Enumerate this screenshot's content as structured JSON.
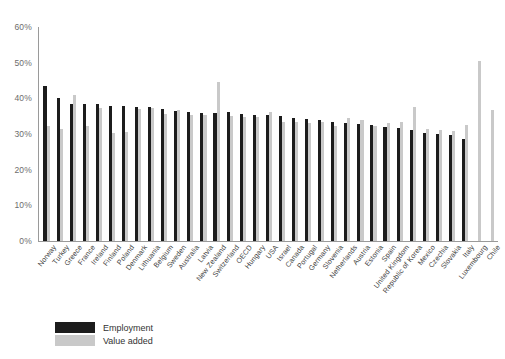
{
  "chart_data": {
    "type": "bar",
    "title": "",
    "subtitle": "",
    "xlabel": "",
    "ylabel": "",
    "ylim": [
      0,
      60
    ],
    "ytick_labels": [
      "0%",
      "10%",
      "20%",
      "30%",
      "40%",
      "50%",
      "60%"
    ],
    "ytick_values": [
      0,
      10,
      20,
      30,
      40,
      50,
      60
    ],
    "grid": false,
    "legend_position": "bottom-left",
    "categories": [
      "Norway",
      "Turkey",
      "Greece",
      "France",
      "Ireland",
      "Finland",
      "Poland",
      "Denmark",
      "Lithuania",
      "Belgium",
      "Sweden",
      "Australia",
      "Latvia",
      "New Zealand",
      "Switzerland",
      "OECD",
      "Hungary",
      "USA",
      "Israel",
      "Canada",
      "Portugal",
      "Germany",
      "Slovenia",
      "Netherlands",
      "Austria",
      "Estonia",
      "Spain",
      "United Kingdom",
      "Republic of Korea",
      "Mexico",
      "Czechia",
      "Slovakia",
      "Italy",
      "Luxembourg",
      "Chile"
    ],
    "series": [
      {
        "name": "Employment",
        "color": "#1c1c1c",
        "values": [
          43.5,
          40.2,
          38.5,
          38.4,
          38.3,
          37.8,
          37.8,
          37.7,
          37.5,
          36.9,
          36.5,
          36.3,
          36.0,
          35.8,
          36.3,
          35.6,
          35.4,
          35.4,
          35.1,
          34.4,
          34.2,
          33.9,
          33.5,
          33.2,
          32.8,
          32.4,
          32.0,
          31.6,
          31.2,
          30.4,
          30.0,
          29.6,
          28.7,
          null,
          null
        ]
      },
      {
        "name": "Value added",
        "color": "#c9c9c9",
        "values": [
          32.2,
          31.3,
          41.0,
          32.3,
          37.3,
          30.2,
          30.7,
          36.9,
          37.2,
          35.5,
          36.6,
          35.4,
          35.2,
          44.5,
          35.0,
          34.8,
          34.9,
          36.2,
          33.3,
          33.4,
          33.0,
          33.5,
          32.2,
          34.4,
          33.8,
          32.2,
          33.1,
          33.3,
          37.6,
          31.5,
          31.0,
          30.8,
          32.6,
          50.5,
          36.6
        ]
      }
    ]
  },
  "legend": {
    "items": [
      {
        "label": "Employment",
        "color": "#1c1c1c"
      },
      {
        "label": "Value added",
        "color": "#c9c9c9"
      }
    ]
  }
}
